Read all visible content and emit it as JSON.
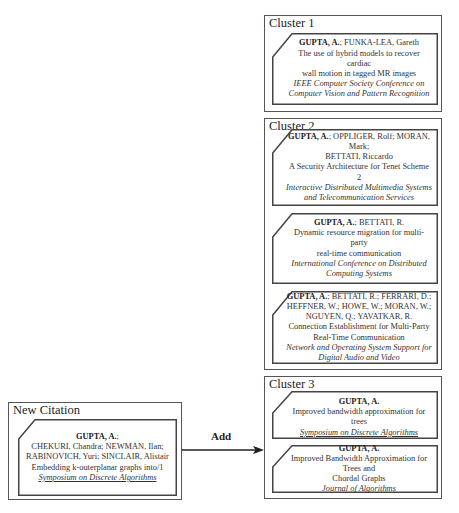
{
  "clusters": [
    {
      "title": "Cluster 1",
      "citations": [
        {
          "lead_author": "GUPTA, A.",
          "other_authors": "; FUNKA-LEA, Gareth",
          "title_lines": [
            "The use of hybrid models to recover cardiac",
            "wall motion in tagged MR images"
          ],
          "venue_lines": [
            "IEEE Computer Society Conference on",
            "Computer Vision and Pattern Recognition"
          ],
          "venue_underlined": false
        }
      ]
    },
    {
      "title": "Cluster 2",
      "citations": [
        {
          "lead_author": "GUPTA, A.",
          "other_authors": "; OPPLIGER, Rolf; MORAN, Mark;",
          "other_authors_line2": "BETTATI, Riccardo",
          "title_lines": [
            "A Security Architecture for Tenet Scheme 2"
          ],
          "venue_lines": [
            "Interactive Distributed Multimedia Systems",
            "and Telecommunication Services"
          ],
          "venue_underlined": false
        },
        {
          "lead_author": "GUPTA, A.",
          "other_authors": "; BETTATI, R.",
          "title_lines": [
            "Dynamic resource migration for multi-party",
            "real-time communication"
          ],
          "venue_lines": [
            "International Conference on Distributed",
            "Computing Systems"
          ],
          "venue_underlined": false
        },
        {
          "lead_author": "GUPTA, A.",
          "other_authors": "; BETTATI, R.; FERRARI, D.;",
          "other_authors_line2": "HEFFNER, W.; HOWE, W.; MORAN, W.;",
          "other_authors_line3": "NGUYEN, Q.; YAVATKAR, R.",
          "title_lines": [
            "Connection Establishment for Multi-Party",
            "Real-Time Communication"
          ],
          "venue_lines": [
            "Network and Operating System Support for",
            "Digital Audio and Video"
          ],
          "venue_underlined": false
        }
      ]
    },
    {
      "title": "Cluster 3",
      "citations": [
        {
          "lead_author": "GUPTA, A.",
          "title_lines": [
            "Improved bandwidth approximation for trees"
          ],
          "venue_lines": [
            "Symposium on Discrete Algorithms"
          ],
          "venue_underlined": true
        },
        {
          "lead_author": "GUPTA, A.",
          "title_lines": [
            "Improved Bandwidth Approximation for Trees and",
            "Chordal Graphs"
          ],
          "venue_lines": [
            "Journal of Algorithms"
          ],
          "venue_underlined": false
        }
      ]
    }
  ],
  "new_citation": {
    "title": "New Citation",
    "lead_author": "GUPTA, A.",
    "other_authors": ";",
    "other_authors_line2": "CHEKURI, Chandra; NEWMAN, Ilan;",
    "other_authors_line3": "RABINOVICH, Yuri; SINCLAIR, Alistair",
    "title_lines": [
      "Embedding k-outerplanar graphs into/1"
    ],
    "venue_lines": [
      "Symposium on Discrete Algorithms"
    ],
    "venue_underlined": true
  },
  "arrow": {
    "label": "Add",
    "target": "Cluster 3"
  },
  "colors": {
    "border": "#555555",
    "text": "#222222",
    "background": "#ffffff"
  }
}
